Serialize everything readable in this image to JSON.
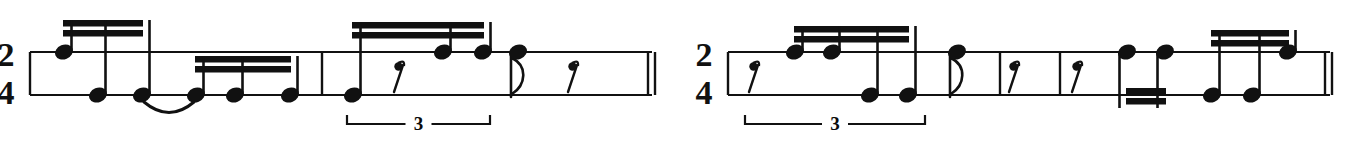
{
  "document": {
    "kind": "music-notation-excerpt",
    "notation_system": "two-line rhythm staff (percussion / clave notation)",
    "systems_count": 2,
    "ink_color": "#111111",
    "paper_color": "#ffffff"
  },
  "systems": [
    {
      "id": "system-1",
      "time_signature": {
        "numerator": "2",
        "denominator": "4"
      },
      "staff": {
        "x_start": 30,
        "x_end": 652,
        "top_line_y": 52,
        "bottom_line_y": 95
      },
      "barlines": [
        {
          "name": "barline-opening",
          "x": 30,
          "kind": "single"
        },
        {
          "name": "barline-1",
          "x": 322,
          "kind": "single"
        },
        {
          "name": "barline-final",
          "x": 648,
          "kind": "double-thin"
        }
      ],
      "notes": [
        {
          "index": 1,
          "x": 64,
          "line": "top",
          "stem": "up",
          "beams": 2,
          "head": "filled"
        },
        {
          "index": 2,
          "x": 98,
          "line": "bottom",
          "stem": "up",
          "beams": 2,
          "head": "filled"
        },
        {
          "index": 3,
          "x": 142,
          "line": "bottom",
          "stem": "up",
          "beams": 2,
          "head": "filled"
        },
        {
          "index": 4,
          "x": 196,
          "line": "bottom",
          "stem": "up",
          "beams": 2,
          "head": "filled"
        },
        {
          "index": 5,
          "x": 235,
          "line": "bottom",
          "stem": "up",
          "beams": 2,
          "head": "filled"
        },
        {
          "index": 6,
          "x": 290,
          "line": "bottom",
          "stem": "up",
          "beams": 2,
          "head": "filled"
        },
        {
          "index": 7,
          "x": 353,
          "line": "bottom",
          "stem": "up",
          "beams": 2,
          "head": "filled"
        },
        {
          "index": 8,
          "x": 443,
          "line": "top",
          "stem": "up",
          "beams": 2,
          "head": "filled"
        },
        {
          "index": 9,
          "x": 483,
          "line": "top",
          "stem": "up",
          "beams": 2,
          "head": "filled"
        },
        {
          "index": 10,
          "x": 518,
          "line": "top",
          "stem": "flag-down",
          "beams": 0,
          "head": "filled"
        }
      ],
      "beam_groups": [
        {
          "name": "beam-group-1",
          "x1": 64,
          "x2": 142,
          "y": 20,
          "count": 2
        },
        {
          "name": "beam-group-2",
          "x1": 196,
          "x2": 290,
          "y": 56,
          "count": 2
        },
        {
          "name": "beam-group-3",
          "x1": 353,
          "x2": 483,
          "y": 22,
          "count": 2
        }
      ],
      "ties": [
        {
          "name": "tie-1",
          "x1": 142,
          "x2": 196,
          "placement": "below"
        }
      ],
      "rests": [
        {
          "name": "eighth-rest-1",
          "x": 397,
          "value": "eighth"
        },
        {
          "name": "eighth-rest-2",
          "x": 571,
          "value": "eighth"
        }
      ],
      "tuplets": [
        {
          "name": "tuplet-bracket-1",
          "number": "3",
          "x1": 347,
          "x2": 490,
          "y": 124
        }
      ]
    },
    {
      "id": "system-2",
      "time_signature": {
        "numerator": "2",
        "denominator": "4"
      },
      "staff": {
        "x_start": 728,
        "x_end": 1330,
        "top_line_y": 52,
        "bottom_line_y": 95
      },
      "barlines": [
        {
          "name": "barline-opening",
          "x": 728,
          "kind": "single"
        },
        {
          "name": "barline-1",
          "x": 1000,
          "kind": "single"
        },
        {
          "name": "barline-2",
          "x": 1060,
          "kind": "single"
        },
        {
          "name": "barline-final",
          "x": 1325,
          "kind": "double-thin"
        }
      ],
      "notes": [
        {
          "index": 1,
          "x": 795,
          "line": "top",
          "stem": "up",
          "beams": 2,
          "head": "filled"
        },
        {
          "index": 2,
          "x": 832,
          "line": "top",
          "stem": "up",
          "beams": 2,
          "head": "filled"
        },
        {
          "index": 3,
          "x": 870,
          "line": "bottom",
          "stem": "up",
          "beams": 2,
          "head": "filled"
        },
        {
          "index": 4,
          "x": 908,
          "line": "bottom",
          "stem": "up",
          "beams": 2,
          "head": "filled"
        },
        {
          "index": 5,
          "x": 957,
          "line": "top",
          "stem": "flag-down",
          "beams": 0,
          "head": "filled"
        },
        {
          "index": 6,
          "x": 1127,
          "line": "top",
          "stem": "down",
          "beams": 2,
          "head": "filled"
        },
        {
          "index": 7,
          "x": 1165,
          "line": "top",
          "stem": "down",
          "beams": 2,
          "head": "filled"
        },
        {
          "index": 8,
          "x": 1212,
          "line": "bottom",
          "stem": "up",
          "beams": 2,
          "head": "filled"
        },
        {
          "index": 9,
          "x": 1252,
          "line": "bottom",
          "stem": "up",
          "beams": 2,
          "head": "filled"
        },
        {
          "index": 10,
          "x": 1288,
          "line": "top",
          "stem": "up",
          "beams": 2,
          "head": "filled"
        }
      ],
      "beam_groups": [
        {
          "name": "beam-group-1",
          "x1": 795,
          "x2": 908,
          "y": 26,
          "count": 2
        },
        {
          "name": "beam-group-2",
          "x1": 1127,
          "x2": 1165,
          "y": 88,
          "count": 2
        },
        {
          "name": "beam-group-3",
          "x1": 1212,
          "x2": 1288,
          "y": 30,
          "count": 2
        }
      ],
      "ties": [],
      "rests": [
        {
          "name": "eighth-rest-1",
          "x": 752,
          "value": "eighth"
        },
        {
          "name": "eighth-rest-2",
          "x": 1012,
          "value": "eighth"
        },
        {
          "name": "eighth-rest-3",
          "x": 1075,
          "value": "eighth"
        }
      ],
      "tuplets": [
        {
          "name": "tuplet-bracket-1",
          "number": "3",
          "x1": 745,
          "x2": 925,
          "y": 124
        }
      ]
    }
  ]
}
